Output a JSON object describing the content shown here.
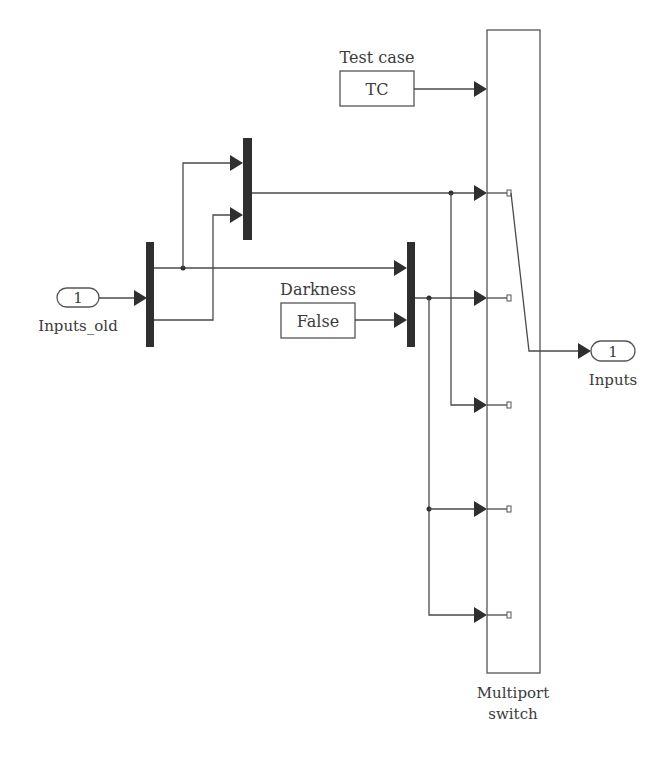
{
  "diagram": {
    "type": "simulink-block-diagram",
    "inport": {
      "number": "1",
      "name": "Inputs_old"
    },
    "outport": {
      "number": "1",
      "name": "Inputs"
    },
    "test_case_block": {
      "label": "Test case",
      "value": "TC"
    },
    "darkness_block": {
      "label": "Darkness",
      "value": "False"
    },
    "switch_block": {
      "label_line1": "Multiport",
      "label_line2": "switch",
      "data_ports": 6
    },
    "blocks": [
      "Inputs_old inport",
      "Demux",
      "Mux (top)",
      "Mux (Darkness)",
      "Test case constant",
      "Darkness constant",
      "Multiport switch",
      "Inputs outport"
    ],
    "colors": {
      "line": "#4a4a4a",
      "bar": "#2f2f2f",
      "text": "#3a3a3a",
      "background": "#ffffff"
    }
  }
}
